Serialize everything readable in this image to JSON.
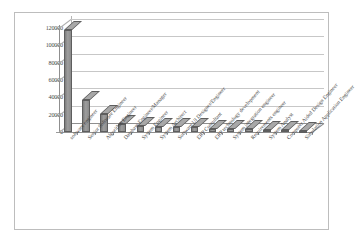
{
  "chart_data": {
    "type": "bar",
    "title": "",
    "subtitle": "",
    "xlabel": "",
    "ylabel": "",
    "ylim": [
      0,
      120000
    ],
    "yticks": [
      0,
      20000,
      40000,
      60000,
      80000,
      100000,
      120000
    ],
    "ytick_labels": [
      "0",
      "20000",
      "40000",
      "60000",
      "80000",
      "100000",
      "120000"
    ],
    "grid": true,
    "legend": false,
    "legend_position": "none",
    "orientation": "vertical",
    "style": "3d-column",
    "bar_color": "#8d8d8d",
    "bar_edge_color": "#5e5e5e",
    "gridline_color": "#c7c7c7",
    "axis_color": "#8f8f8f",
    "frame_color": "#bdbdbd",
    "categories": [
      "software engineer",
      "Senior Software Engineer",
      "Algorithm Engineer",
      "Database Engineer/Manager",
      "System Engineer",
      "System Architect",
      "Software UI Designer/Engineer",
      "ERP Consultant",
      "ERP technology development",
      "System integration engineer",
      "Requirements engineer",
      "System Analyst",
      "Computer Aided Design Engineer",
      "Simulation Application Engineer"
    ],
    "values": [
      118000,
      37000,
      21000,
      9000,
      6500,
      6000,
      5500,
      5500,
      4000,
      3500,
      3500,
      2000,
      1800,
      1200
    ]
  }
}
